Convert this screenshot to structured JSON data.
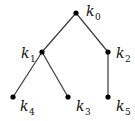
{
  "diagram": {
    "type": "tree",
    "nodes": [
      {
        "id": "k0",
        "base": "k",
        "sub": "0",
        "x": 76,
        "y": 13,
        "lx": 86,
        "ly": 16
      },
      {
        "id": "k1",
        "base": "k",
        "sub": "1",
        "x": 42,
        "y": 52,
        "lx": 21,
        "ly": 58
      },
      {
        "id": "k2",
        "base": "k",
        "sub": "2",
        "x": 108,
        "y": 52,
        "lx": 116,
        "ly": 58
      },
      {
        "id": "k4",
        "base": "k",
        "sub": "4",
        "x": 13,
        "y": 97,
        "lx": 20,
        "ly": 111
      },
      {
        "id": "k3",
        "base": "k",
        "sub": "3",
        "x": 68,
        "y": 97,
        "lx": 76,
        "ly": 111
      },
      {
        "id": "k5",
        "base": "k",
        "sub": "5",
        "x": 108,
        "y": 97,
        "lx": 116,
        "ly": 111
      }
    ],
    "edges": [
      [
        "k0",
        "k1"
      ],
      [
        "k0",
        "k2"
      ],
      [
        "k1",
        "k4"
      ],
      [
        "k1",
        "k3"
      ],
      [
        "k2",
        "k5"
      ]
    ],
    "colors": {
      "edge": "#3a3a3a",
      "node": "#000000",
      "label": "#111111",
      "background": "#ffffff"
    }
  }
}
